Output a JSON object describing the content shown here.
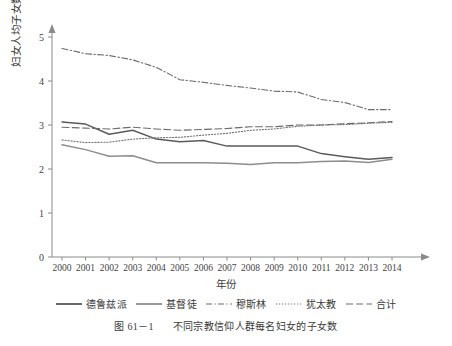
{
  "chart_data": {
    "type": "line",
    "title": "",
    "xlabel": "年份",
    "ylabel": "妇女人均子女数",
    "categories": [
      "2000",
      "2001",
      "2002",
      "2003",
      "2004",
      "2005",
      "2006",
      "2007",
      "2008",
      "2009",
      "2010",
      "2011",
      "2012",
      "2013",
      "2014"
    ],
    "x": [
      2000,
      2001,
      2002,
      2003,
      2004,
      2005,
      2006,
      2007,
      2008,
      2009,
      2010,
      2011,
      2012,
      2013,
      2014
    ],
    "ylim": [
      0,
      5.4
    ],
    "yticks": [
      0,
      1,
      2,
      3,
      4,
      5
    ],
    "xlim": [
      2000,
      2014
    ],
    "grid": false,
    "legend_position": "bottom",
    "series": [
      {
        "name": "德鲁兹派",
        "style": "solid",
        "color": "#5a5a5a",
        "values": [
          3.07,
          3.02,
          2.79,
          2.88,
          2.68,
          2.62,
          2.65,
          2.52,
          2.52,
          2.52,
          2.52,
          2.35,
          2.28,
          2.22,
          2.26
        ]
      },
      {
        "name": "基督徒",
        "style": "solid",
        "color": "#8d8d8d",
        "values": [
          2.55,
          2.44,
          2.29,
          2.3,
          2.14,
          2.14,
          2.14,
          2.13,
          2.1,
          2.14,
          2.14,
          2.17,
          2.18,
          2.15,
          2.22
        ]
      },
      {
        "name": "穆斯林",
        "style": "dashdot",
        "color": "#6b6b6b",
        "values": [
          4.74,
          4.62,
          4.58,
          4.48,
          4.31,
          4.03,
          3.97,
          3.9,
          3.84,
          3.77,
          3.75,
          3.58,
          3.51,
          3.35,
          3.35
        ]
      },
      {
        "name": "犹太教",
        "style": "dotted",
        "color": "#707070",
        "values": [
          2.66,
          2.6,
          2.61,
          2.68,
          2.71,
          2.72,
          2.77,
          2.81,
          2.88,
          2.91,
          2.97,
          3.0,
          3.01,
          3.04,
          3.06
        ]
      },
      {
        "name": "合计",
        "style": "dashed",
        "color": "#6b6b6b",
        "values": [
          2.95,
          2.93,
          2.91,
          2.95,
          2.91,
          2.88,
          2.9,
          2.92,
          2.96,
          2.96,
          3.0,
          3.0,
          3.03,
          3.05,
          3.08
        ]
      }
    ]
  },
  "axes": {
    "y_title": "妇女人均子女数",
    "x_title": "年份",
    "y_tick_labels": [
      "0",
      "1",
      "2",
      "3",
      "4",
      "5"
    ],
    "x_tick_labels": [
      "2000",
      "2001",
      "2002",
      "2003",
      "2004",
      "2005",
      "2006",
      "2007",
      "2008",
      "2009",
      "2010",
      "2011",
      "2012",
      "2013",
      "2014"
    ]
  },
  "legend": {
    "items": [
      {
        "label": "德鲁兹派",
        "style": "solid"
      },
      {
        "label": "基督徒",
        "style": "solid"
      },
      {
        "label": "穆斯林",
        "style": "dashdot"
      },
      {
        "label": "犹太教",
        "style": "dotted"
      },
      {
        "label": "合计",
        "style": "dashed"
      }
    ]
  },
  "caption": {
    "number": "图 61－1",
    "text": "不同宗教信仰人群每名妇女的子女数"
  }
}
